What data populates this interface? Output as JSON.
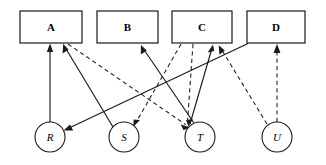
{
  "diagram": {
    "canvas": {
      "width": 326,
      "height": 165,
      "background": "#ffffff"
    },
    "stroke_color": "#1a1a1a",
    "box_nodes": [
      {
        "id": "A",
        "label": "A",
        "x": 20,
        "y": 11,
        "w": 62,
        "h": 32,
        "cx": 51,
        "cy": 27
      },
      {
        "id": "B",
        "label": "B",
        "x": 97,
        "y": 11,
        "w": 61,
        "h": 32,
        "cx": 127.5,
        "cy": 27
      },
      {
        "id": "C",
        "label": "C",
        "x": 172,
        "y": 11,
        "w": 60,
        "h": 32,
        "cx": 202,
        "cy": 27
      },
      {
        "id": "D",
        "label": "D",
        "x": 247,
        "y": 11,
        "w": 58,
        "h": 32,
        "cx": 276,
        "cy": 27
      }
    ],
    "circle_nodes": [
      {
        "id": "R",
        "label": "R",
        "cx": 50,
        "cy": 137,
        "r": 15
      },
      {
        "id": "S",
        "label": "S",
        "cx": 124,
        "cy": 137,
        "r": 15
      },
      {
        "id": "T",
        "label": "T",
        "cx": 200,
        "cy": 137,
        "r": 15
      },
      {
        "id": "U",
        "label": "U",
        "cx": 277,
        "cy": 137,
        "r": 15
      }
    ],
    "edges": [
      {
        "id": "R-to-A",
        "from": "R",
        "to": "A",
        "style": "solid",
        "x1": 50,
        "y1": 122,
        "x2": 50,
        "y2": 44
      },
      {
        "id": "S-to-A",
        "from": "S",
        "to": "A",
        "style": "solid",
        "x1": 113,
        "y1": 127,
        "x2": 63,
        "y2": 44
      },
      {
        "id": "D-to-R",
        "from": "D",
        "to": "A",
        "style": "solid",
        "x1": 248,
        "y1": 43,
        "x2": 64,
        "y2": 130
      },
      {
        "id": "T-to-B",
        "from": "T",
        "to": "B",
        "style": "solid",
        "x1": 194,
        "y1": 123,
        "x2": 141,
        "y2": 45
      },
      {
        "id": "T-to-C",
        "from": "T",
        "to": "C",
        "style": "solid",
        "x1": 190,
        "y1": 124,
        "x2": 213,
        "y2": 45
      },
      {
        "id": "A-to-T",
        "from": "A",
        "to": "T",
        "style": "dashed",
        "x1": 68,
        "y1": 44,
        "x2": 189,
        "y2": 127
      },
      {
        "id": "C-to-S",
        "from": "C",
        "to": "S",
        "style": "dashed",
        "x1": 181,
        "y1": 44,
        "x2": 133,
        "y2": 126
      },
      {
        "id": "C-to-T",
        "from": "C",
        "to": "T",
        "style": "dashed",
        "x1": 193,
        "y1": 44,
        "x2": 187,
        "y2": 125
      },
      {
        "id": "U-to-C",
        "from": "U",
        "to": "C",
        "style": "dashed",
        "x1": 267,
        "y1": 124,
        "x2": 219,
        "y2": 45
      },
      {
        "id": "U-to-D",
        "from": "U",
        "to": "D",
        "style": "dashed",
        "x1": 277,
        "y1": 122,
        "x2": 277,
        "y2": 45
      }
    ],
    "legend": {
      "solid_meaning": "solid arrow",
      "dashed_meaning": "dashed arrow"
    }
  }
}
